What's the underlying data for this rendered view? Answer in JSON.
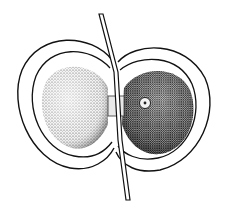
{
  "figure": {
    "colors": {
      "background": "#ffffff",
      "ink": "#111111",
      "stipple_light": "#9a9a9a",
      "stipple_dark": "#2a2a2a"
    }
  }
}
